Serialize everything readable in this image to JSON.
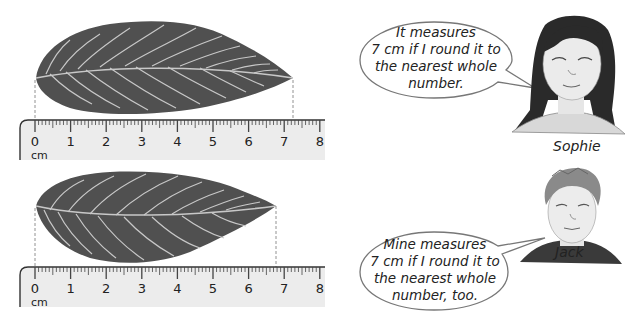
{
  "colors": {
    "leaf": "#505050",
    "vein": "#c8c8c8",
    "ruler_fill": "#ececec",
    "ruler_edge": "#333333",
    "bubble_stroke": "#777777"
  },
  "rulers": [
    {
      "id": "top",
      "unit": "cm",
      "labels": [
        "0",
        "1",
        "2",
        "3",
        "4",
        "5",
        "6",
        "7",
        "8"
      ],
      "leaf_length_cm": 7.25
    },
    {
      "id": "bottom",
      "unit": "cm",
      "labels": [
        "0",
        "1",
        "2",
        "3",
        "4",
        "5",
        "6",
        "7",
        "8"
      ],
      "leaf_length_cm": 6.8
    }
  ],
  "characters": [
    {
      "name": "Sophie",
      "speech": [
        "It measures",
        "7 cm if I round it to",
        "the nearest whole",
        "number."
      ]
    },
    {
      "name": "Jack",
      "speech": [
        "Mine measures",
        "7 cm if I round it to",
        "the nearest whole",
        "number, too."
      ]
    }
  ]
}
